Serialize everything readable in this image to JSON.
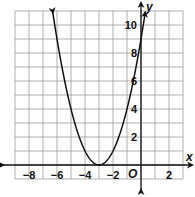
{
  "chart_data": {
    "type": "line",
    "title": "",
    "xlabel": "x",
    "ylabel": "y",
    "origin_label": "O",
    "xlim": [
      -9,
      3
    ],
    "ylim": [
      -1,
      11
    ],
    "grid": true,
    "x_tick_labels": [
      "-8",
      "-6",
      "-4",
      "-2",
      "2"
    ],
    "x_ticks": [
      -8,
      -6,
      -4,
      -2,
      2
    ],
    "y_tick_labels": [
      "2",
      "4",
      "6",
      "8",
      "10"
    ],
    "y_ticks": [
      2,
      4,
      6,
      8,
      10
    ],
    "series": [
      {
        "name": "y = (x + 3)^2",
        "equation": "y = (x+3)^2",
        "vertex": [
          -3,
          0
        ],
        "x": [
          -6.3,
          -6,
          -5,
          -4,
          -3,
          -2,
          -1,
          0,
          0.3
        ],
        "y": [
          10.89,
          9,
          4,
          1,
          0,
          1,
          4,
          9,
          10.89
        ],
        "arrows_on_ends": true
      }
    ],
    "legend": null
  },
  "colors": {
    "grid": "#9a9a9a",
    "axis": "#111111",
    "curve": "#111111",
    "background": "#ffffff"
  }
}
